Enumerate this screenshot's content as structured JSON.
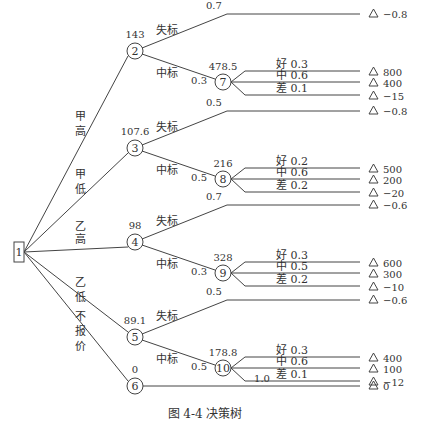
{
  "title": "决策树",
  "caption": {
    "figure": "图 4-4",
    "text": "决策树"
  },
  "decision_node": {
    "id": "1"
  },
  "branches": [
    {
      "label": "甲高",
      "node": "2",
      "ev": "143",
      "lose": {
        "label": "失标",
        "p": "0.7",
        "payoff": "−0.8"
      },
      "win": {
        "label": "中标",
        "p": "0.3",
        "node": "7",
        "ev": "478.5",
        "outcomes": [
          {
            "label": "好",
            "p": "0.3",
            "payoff": "800"
          },
          {
            "label": "中",
            "p": "0.6",
            "payoff": "400"
          },
          {
            "label": "差",
            "p": "0.1",
            "payoff": "−15"
          }
        ]
      }
    },
    {
      "label": "甲低",
      "node": "3",
      "ev": "107.6",
      "lose": {
        "label": "失标",
        "p": "0.5",
        "payoff": "−0.8"
      },
      "win": {
        "label": "中标",
        "p": "0.5",
        "node": "8",
        "ev": "216",
        "outcomes": [
          {
            "label": "好",
            "p": "0.2",
            "payoff": "500"
          },
          {
            "label": "中",
            "p": "0.6",
            "payoff": "200"
          },
          {
            "label": "差",
            "p": "0.2",
            "payoff": "−20"
          }
        ]
      }
    },
    {
      "label": "乙高",
      "node": "4",
      "ev": "98",
      "lose": {
        "label": "失标",
        "p": "0.7",
        "payoff": "−0.6"
      },
      "win": {
        "label": "中标",
        "p": "0.3",
        "node": "9",
        "ev": "328",
        "outcomes": [
          {
            "label": "好",
            "p": "0.3",
            "payoff": "600"
          },
          {
            "label": "中",
            "p": "0.5",
            "payoff": "300"
          },
          {
            "label": "差",
            "p": "0.2",
            "payoff": "−10"
          }
        ]
      }
    },
    {
      "label": "乙低",
      "node": "5",
      "ev": "89.1",
      "lose": {
        "label": "失标",
        "p": "0.5",
        "payoff": "−0.6"
      },
      "win": {
        "label": "中标",
        "p": "0.5",
        "node": "10",
        "ev": "178.8",
        "outcomes": [
          {
            "label": "好",
            "p": "0.3",
            "payoff": "400"
          },
          {
            "label": "中",
            "p": "0.6",
            "payoff": "100"
          },
          {
            "label": "差",
            "p": "0.1",
            "payoff": "−12"
          }
        ]
      }
    },
    {
      "label": "不报价",
      "node": "6",
      "ev": "0",
      "direct": {
        "p": "1.0",
        "payoff": "0"
      }
    }
  ]
}
